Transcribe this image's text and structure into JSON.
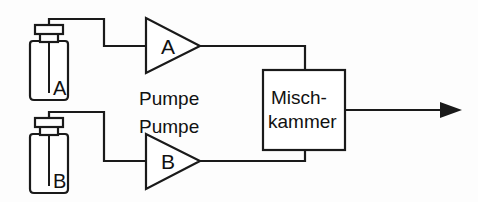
{
  "diagram": {
    "background_color": "#fdfdfd",
    "line_color": "#1a1a1a",
    "bottles": [
      {
        "id": "bottle-a",
        "label": "A",
        "name": "reagent-bottle-a"
      },
      {
        "id": "bottle-b",
        "label": "B",
        "name": "reagent-bottle-b"
      }
    ],
    "pumps": [
      {
        "id": "pump-a",
        "symbol_label": "A",
        "caption": "Pumpe",
        "caption_position": "below"
      },
      {
        "id": "pump-b",
        "symbol_label": "B",
        "caption": "Pumpe",
        "caption_position": "above"
      }
    ],
    "mixing_chamber": {
      "id": "mixing-chamber",
      "line_1": "Misch-",
      "line_2": "kammer"
    },
    "output": {
      "id": "output-arrow",
      "direction": "right",
      "label": ""
    },
    "connections": [
      {
        "from": "bottle-a",
        "to": "pump-a"
      },
      {
        "from": "pump-a",
        "to": "mixing-chamber"
      },
      {
        "from": "bottle-b",
        "to": "pump-b"
      },
      {
        "from": "pump-b",
        "to": "mixing-chamber"
      },
      {
        "from": "mixing-chamber",
        "to": "output"
      }
    ]
  }
}
